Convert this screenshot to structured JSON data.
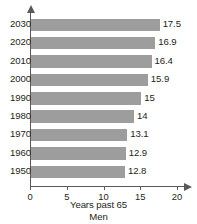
{
  "chart_data": {
    "type": "bar",
    "orientation": "horizontal",
    "title": "",
    "xlabel": "Years past 65",
    "sublabel": "Men",
    "ylabel": "",
    "categories": [
      "2030",
      "2020",
      "2010",
      "2000",
      "1990",
      "1980",
      "1970",
      "1960",
      "1950"
    ],
    "values": [
      17.5,
      16.9,
      16.4,
      15.9,
      15,
      14,
      13.1,
      12.9,
      12.8
    ],
    "value_labels": [
      "17.5",
      "16.9",
      "16.4",
      "15.9",
      "15",
      "14",
      "13.1",
      "12.9",
      "12.8"
    ],
    "xlim": [
      0,
      20
    ],
    "xticks": [
      0,
      5,
      10,
      15,
      20
    ],
    "xtick_labels": [
      "0",
      "5",
      "10",
      "15",
      "20"
    ],
    "grid": false,
    "legend": null,
    "bar_color": "#9d9d9d",
    "axis_color": "#58595b",
    "text_color": "#231f20",
    "background": "#ffffff"
  }
}
